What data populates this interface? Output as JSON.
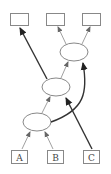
{
  "diagram": {
    "type": "graph",
    "inputs": [
      {
        "id": "A",
        "label": "A"
      },
      {
        "id": "B",
        "label": "B"
      },
      {
        "id": "C",
        "label": "C"
      }
    ],
    "outputs": [
      {
        "id": "out1",
        "label": ""
      },
      {
        "id": "out2",
        "label": ""
      },
      {
        "id": "out3",
        "label": ""
      }
    ],
    "nodes": [
      {
        "id": "lower",
        "shape": "ellipse",
        "label": ""
      },
      {
        "id": "middle",
        "shape": "ellipse",
        "label": ""
      },
      {
        "id": "upper",
        "shape": "ellipse",
        "label": ""
      }
    ],
    "edges": [
      {
        "from": "A",
        "to": "lower",
        "style": "thin"
      },
      {
        "from": "B",
        "to": "lower",
        "style": "thin"
      },
      {
        "from": "lower",
        "to": "middle",
        "style": "thin"
      },
      {
        "from": "middle",
        "to": "upper",
        "style": "thin"
      },
      {
        "from": "upper",
        "to": "out2",
        "style": "thin"
      },
      {
        "from": "upper",
        "to": "out3",
        "style": "thin"
      },
      {
        "from": "C",
        "to": "middle",
        "style": "thick"
      },
      {
        "from": "middle",
        "to": "out1",
        "style": "thick"
      },
      {
        "from": "lower",
        "to": "upper",
        "style": "thick-curved"
      }
    ]
  }
}
